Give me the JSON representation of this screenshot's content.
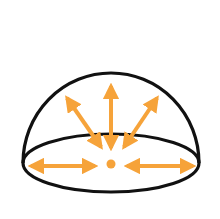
{
  "figure": {
    "colors": {
      "outline": "#111111",
      "arrow": "#F6A33A",
      "background": "#FFFFFF"
    },
    "dome": {
      "cx": 111,
      "cy": 163,
      "rx": 88,
      "ry": 29,
      "top": 73
    },
    "center_dot": {
      "cx": 111,
      "cy": 164,
      "r": 4.5
    },
    "arrows": [
      {
        "name": "arrow-up-left",
        "x1": 101,
        "y1": 147,
        "x2": 67,
        "y2": 98
      },
      {
        "name": "arrow-up",
        "x1": 111,
        "y1": 148,
        "x2": 111,
        "y2": 86
      },
      {
        "name": "arrow-up-right",
        "x1": 124,
        "y1": 147,
        "x2": 157,
        "y2": 98
      },
      {
        "name": "arrow-left",
        "x1": 31,
        "y1": 166,
        "x2": 95,
        "y2": 166
      },
      {
        "name": "arrow-right",
        "x1": 127,
        "y1": 166,
        "x2": 193,
        "y2": 166
      }
    ]
  }
}
